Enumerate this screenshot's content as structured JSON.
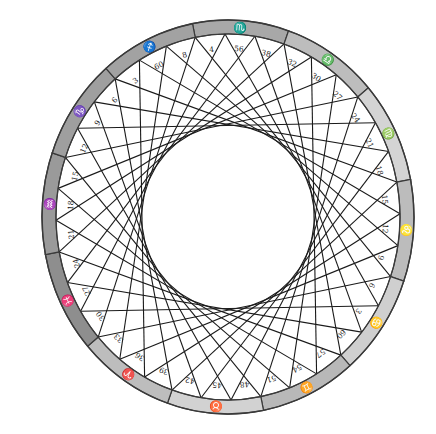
{
  "diagram": {
    "title": "",
    "center": {
      "x": 228,
      "y": 217
    },
    "ring": {
      "outer_rx": 186,
      "outer_ry": 197,
      "inner_rx": 172,
      "inner_ry": 183,
      "stroke": "#3a3a3a"
    },
    "chord_color": "#1a1a1a",
    "chord_step": 12,
    "point_count": 36,
    "start_angle_deg": -11,
    "signs": [
      {
        "name": "Scorpio",
        "glyph": "♏",
        "color": "#a8a8a8"
      },
      {
        "name": "Libra",
        "glyph": "♎",
        "color": "#bdbdbd"
      },
      {
        "name": "Virgo",
        "glyph": "♍",
        "color": "#d4d4d4"
      },
      {
        "name": "Leo",
        "glyph": "♌",
        "color": "#bcbcbc"
      },
      {
        "name": "Cancer",
        "glyph": "♋",
        "color": "#cfcfcf"
      },
      {
        "name": "Gemini",
        "glyph": "♊",
        "color": "#b8b8b8"
      },
      {
        "name": "Taurus",
        "glyph": "♉",
        "color": "#d2d2d2"
      },
      {
        "name": "Aries",
        "glyph": "♈",
        "color": "#bdbdbd"
      },
      {
        "name": "Pisces",
        "glyph": "♓",
        "color": "#8e8e8e"
      },
      {
        "name": "Aquarius",
        "glyph": "♒",
        "color": "#9a9a9a"
      },
      {
        "name": "Capricorn",
        "glyph": "♑",
        "color": "#9f9f9f"
      },
      {
        "name": "Sagittarius",
        "glyph": "♐",
        "color": "#a2a2a2"
      }
    ],
    "point_labels": [
      "4",
      "56",
      "38",
      "32",
      "30",
      "27",
      "24",
      "21",
      "18",
      "15",
      "12",
      "9",
      "6",
      "3",
      "60",
      "57",
      "54",
      "51",
      "48",
      "45",
      "42",
      "39",
      "36",
      "33",
      "30",
      "27",
      "24",
      "21",
      "18",
      "15",
      "12",
      "9",
      "6",
      "3",
      "60",
      "8"
    ]
  }
}
